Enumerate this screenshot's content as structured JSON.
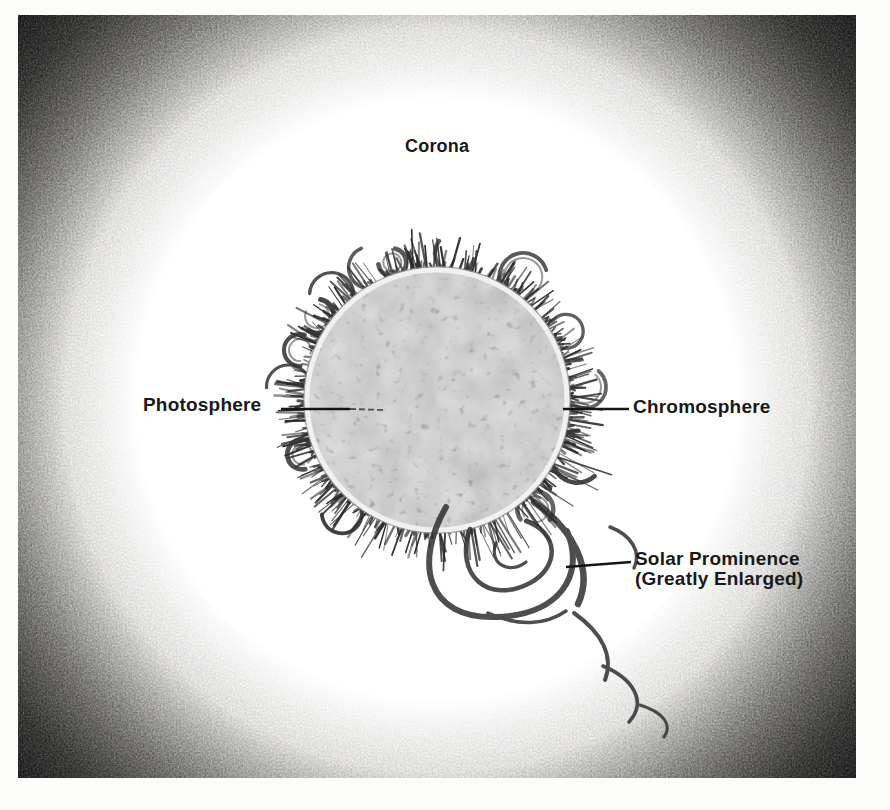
{
  "diagram": {
    "labels": {
      "corona": "Corona",
      "photosphere": "Photosphere",
      "chromosphere": "Chromosphere",
      "prominence_line1": "Solar Prominence",
      "prominence_line2": "(Greatly Enlarged)"
    },
    "colors": {
      "page_bg": "#fcfcfb",
      "glow_white": "#ffffff",
      "vignette_dark": "#161514",
      "disk_fill": "#a2a19f",
      "disk_rim_highlight": "#f2f1ee",
      "fringe_stroke": "#2c2c2c",
      "prominence_stroke": "#303030",
      "leader_line": "#151515",
      "label_text": "#191919"
    }
  }
}
